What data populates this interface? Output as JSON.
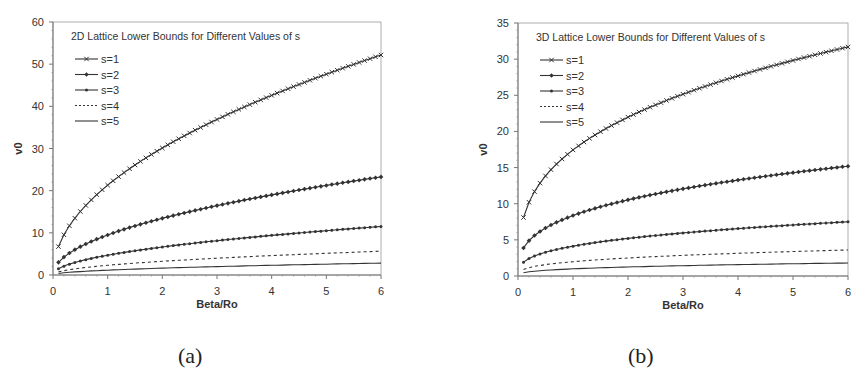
{
  "chart_data": [
    {
      "type": "line",
      "panel_label": "(a)",
      "title": "2D Lattice Lower Bounds for Different Values of s",
      "xlabel": "Beta/Ro",
      "ylabel": "v0",
      "xlim": [
        0,
        6
      ],
      "ylim": [
        0,
        60
      ],
      "xticks": [
        "0",
        "1",
        "2",
        "3",
        "4",
        "5",
        "6"
      ],
      "yticks": [
        "0",
        "10",
        "20",
        "30",
        "40",
        "50",
        "60"
      ],
      "grid": false,
      "legend_position": "upper-left-inside",
      "x": [
        0.1,
        0.2,
        0.3,
        0.4,
        0.5,
        0.6,
        0.7,
        0.8,
        0.9,
        1.0,
        1.1,
        1.2,
        1.3,
        1.4,
        1.5,
        1.6,
        1.7,
        1.8,
        1.9,
        2.0,
        2.1,
        2.2,
        2.3,
        2.4,
        2.5,
        2.6,
        2.7,
        2.8,
        2.9,
        3.0,
        3.1,
        3.2,
        3.3,
        3.4,
        3.5,
        3.6,
        3.7,
        3.8,
        3.9,
        4.0,
        4.1,
        4.2,
        4.3,
        4.4,
        4.5,
        4.6,
        4.7,
        4.8,
        4.9,
        5.0,
        5.1,
        5.2,
        5.3,
        5.4,
        5.5,
        5.6,
        5.7,
        5.8,
        5.9,
        6.0
      ],
      "series": [
        {
          "name": "s=1",
          "marker": "x",
          "style": "solid",
          "coef": 21.3,
          "exponent": 0.5,
          "start": 6.7,
          "end": 52.2
        },
        {
          "name": "s=2",
          "marker": "diamond",
          "style": "solid",
          "coef": 9.5,
          "exponent": 0.5,
          "start": 3.0,
          "end": 23.3
        },
        {
          "name": "s=3",
          "marker": "dot",
          "style": "solid",
          "coef": 4.7,
          "exponent": 0.5,
          "start": 1.5,
          "end": 11.5
        },
        {
          "name": "s=4",
          "marker": "none",
          "style": "dashed",
          "coef": 2.3,
          "exponent": 0.5,
          "start": 0.7,
          "end": 5.6
        },
        {
          "name": "s=5",
          "marker": "none",
          "style": "solid",
          "coef": 1.15,
          "exponent": 0.5,
          "start": 0.4,
          "end": 2.8
        }
      ]
    },
    {
      "type": "line",
      "panel_label": "(b)",
      "title": "3D Lattice Lower Bounds for Different Values of s",
      "xlabel": "Beta/Ro",
      "ylabel": "v0",
      "xlim": [
        0,
        6
      ],
      "ylim": [
        0,
        35
      ],
      "xticks": [
        "0",
        "1",
        "2",
        "3",
        "4",
        "5",
        "6"
      ],
      "yticks": [
        "0",
        "5",
        "10",
        "15",
        "20",
        "25",
        "30",
        "35"
      ],
      "grid": false,
      "legend_position": "upper-left-inside",
      "x": [
        0.1,
        0.2,
        0.3,
        0.4,
        0.5,
        0.6,
        0.7,
        0.8,
        0.9,
        1.0,
        1.1,
        1.2,
        1.3,
        1.4,
        1.5,
        1.6,
        1.7,
        1.8,
        1.9,
        2.0,
        2.1,
        2.2,
        2.3,
        2.4,
        2.5,
        2.6,
        2.7,
        2.8,
        2.9,
        3.0,
        3.1,
        3.2,
        3.3,
        3.4,
        3.5,
        3.6,
        3.7,
        3.8,
        3.9,
        4.0,
        4.1,
        4.2,
        4.3,
        4.4,
        4.5,
        4.6,
        4.7,
        4.8,
        4.9,
        5.0,
        5.1,
        5.2,
        5.3,
        5.4,
        5.5,
        5.6,
        5.7,
        5.8,
        5.9,
        6.0
      ],
      "series": [
        {
          "name": "s=1",
          "marker": "x",
          "style": "solid",
          "coef": 17.44,
          "exponent": 0.3333,
          "start": 8.1,
          "end": 31.7
        },
        {
          "name": "s=2",
          "marker": "diamond",
          "style": "solid",
          "coef": 8.36,
          "exponent": 0.3333,
          "start": 3.9,
          "end": 15.2
        },
        {
          "name": "s=3",
          "marker": "dot",
          "style": "solid",
          "coef": 4.13,
          "exponent": 0.3333,
          "start": 1.9,
          "end": 7.5
        },
        {
          "name": "s=4",
          "marker": "none",
          "style": "dashed",
          "coef": 1.98,
          "exponent": 0.3333,
          "start": 0.9,
          "end": 3.6
        },
        {
          "name": "s=5",
          "marker": "none",
          "style": "solid",
          "coef": 0.99,
          "exponent": 0.3333,
          "start": 0.5,
          "end": 1.8
        }
      ]
    }
  ],
  "colors": {
    "line": "#333333",
    "axis": "#777777",
    "text": "#333333",
    "background": "#ffffff"
  }
}
